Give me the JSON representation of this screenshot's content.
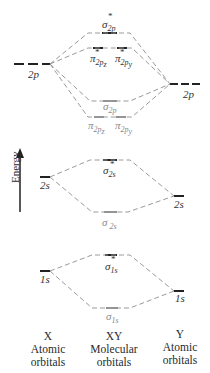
{
  "diagram": {
    "title": "",
    "axis": {
      "label": "Energy",
      "direction": "up"
    },
    "columns": [
      {
        "id": "X",
        "name": "X",
        "desc": "Atomic orbitals"
      },
      {
        "id": "XY",
        "name": "XY",
        "desc": "Molecular orbitals"
      },
      {
        "id": "Y",
        "name": "Y",
        "desc": "Atomic orbitals"
      }
    ],
    "atomic_orbitals": {
      "X": [
        {
          "label": "2p",
          "degenerate": 3
        },
        {
          "label": "2s",
          "degenerate": 1
        },
        {
          "label": "1s",
          "degenerate": 1
        }
      ],
      "Y": [
        {
          "label": "2p",
          "degenerate": 3
        },
        {
          "label": "2s",
          "degenerate": 1
        },
        {
          "label": "1s",
          "degenerate": 1
        }
      ]
    },
    "molecular_orbitals": [
      {
        "symbol": "σ",
        "sub": "2p",
        "antibonding": true
      },
      {
        "symbol": "π",
        "sub": "2pz",
        "antibonding": true
      },
      {
        "symbol": "π",
        "sub": "2py",
        "antibonding": true
      },
      {
        "symbol": "σ",
        "sub": "2p",
        "antibonding": false
      },
      {
        "symbol": "π",
        "sub": "2pz",
        "antibonding": false
      },
      {
        "symbol": "π",
        "sub": "2py",
        "antibonding": false
      },
      {
        "symbol": "σ",
        "sub": "2s",
        "antibonding": true
      },
      {
        "symbol": "σ",
        "sub": "2s",
        "antibonding": false
      },
      {
        "symbol": "σ",
        "sub": "1s",
        "antibonding": true
      },
      {
        "symbol": "σ",
        "sub": "1s",
        "antibonding": false
      }
    ]
  },
  "labels": {
    "energy": "Energy",
    "x_name": "X",
    "x_desc1": "Atomic",
    "x_desc2": "orbitals",
    "xy_name": "XY",
    "xy_desc1": "Molecular",
    "xy_desc2": "orbitals",
    "y_name": "Y",
    "y_desc1": "Atomic",
    "y_desc2": "orbitals",
    "left_2p": "2p",
    "right_2p": "2p",
    "left_2s": "2s",
    "right_2s": "2s",
    "left_1s": "1s",
    "right_1s": "1s",
    "sigma": "σ",
    "pi": "π",
    "star": "*",
    "sub_2p": "2p",
    "sub_2pz": "2p",
    "sub_2py": "2p",
    "sub_z": "z",
    "sub_y": "y",
    "sub_2s": "2s",
    "sub_1s": "1s"
  },
  "colors": {
    "level_line": "#222222",
    "connector": "#9a9a9a",
    "grey_label": "#8a8a8a",
    "text": "#2a2a2a"
  }
}
